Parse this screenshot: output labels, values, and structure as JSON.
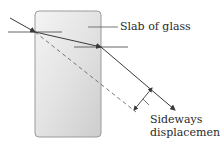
{
  "labels": {
    "slab": "Slab of glass",
    "displacement_line1": "Sideways",
    "displacement_line2": "displacement"
  },
  "colors": {
    "ray": "#3a3a3a",
    "normal": "#555555",
    "dashed": "#6a6a6a",
    "slab_border": "#9a9a9a",
    "slab_light": "#f2f2f2",
    "slab_dark": "#cfcfcf"
  },
  "geometry": {
    "slab": {
      "x": 35,
      "y": 11,
      "width": 66,
      "height": 126,
      "radius": 4
    },
    "incident_ray": {
      "from": [
        10,
        18
      ],
      "to": [
        35,
        32
      ]
    },
    "refracted_ray": {
      "from": [
        35,
        32
      ],
      "to": [
        101,
        47
      ]
    },
    "emergent_ray": {
      "from": [
        101,
        47
      ],
      "to": [
        175,
        110
      ]
    },
    "dashed_extension": {
      "from": [
        35,
        32
      ],
      "to": [
        136,
        112
      ]
    },
    "normal_entry": {
      "from": [
        8,
        32
      ],
      "to": [
        62,
        32
      ]
    },
    "normal_exit": {
      "from": [
        74,
        47
      ],
      "to": [
        128,
        47
      ]
    },
    "displacement_arrow": {
      "from": [
        134,
        110
      ],
      "to": [
        152,
        88
      ]
    },
    "slab_leader": {
      "from": [
        88,
        27
      ],
      "to": [
        118,
        27
      ]
    },
    "displacement_leader": {
      "from": [
        143,
        99
      ],
      "to": [
        149,
        105
      ]
    }
  }
}
